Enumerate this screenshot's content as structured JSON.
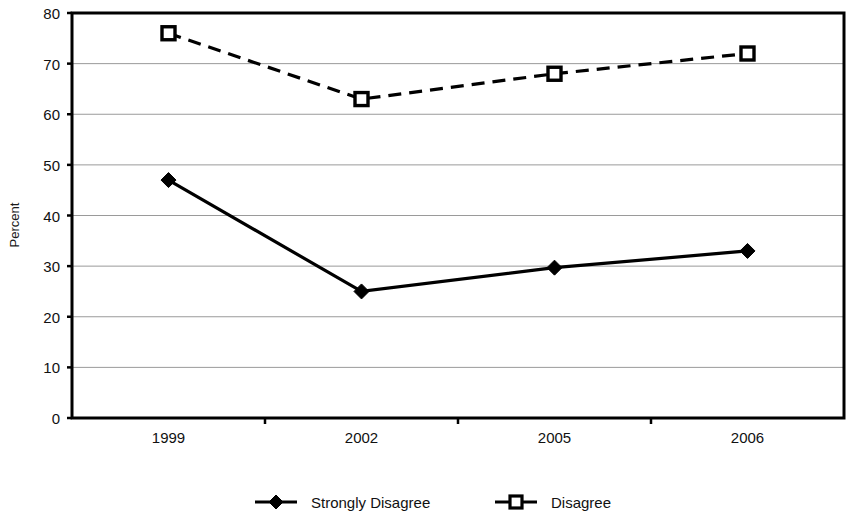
{
  "chart_data": {
    "type": "line",
    "title": "",
    "xlabel": "",
    "ylabel": "Percent",
    "categories": [
      "1999",
      "2002",
      "2005",
      "2006"
    ],
    "ylim": [
      0,
      80
    ],
    "ytick_step": 10,
    "yticks": [
      "0",
      "10",
      "20",
      "30",
      "40",
      "50",
      "60",
      "70",
      "80"
    ],
    "grid": "horizontal",
    "legend_position": "bottom",
    "series": [
      {
        "name": "Strongly Disagree",
        "values": [
          47,
          25,
          29.7,
          33
        ],
        "line_style": "solid",
        "marker": "filled-diamond",
        "color": "#000000"
      },
      {
        "name": "Disagree",
        "values": [
          76,
          63,
          68,
          72
        ],
        "line_style": "dashed",
        "marker": "open-square",
        "color": "#000000"
      }
    ]
  },
  "axis": {
    "y_label": "Percent"
  },
  "legend": {
    "items": [
      {
        "label": "Strongly Disagree"
      },
      {
        "label": "Disagree"
      }
    ]
  },
  "colors": {
    "series": "#000000",
    "grid": "#9a9a9a",
    "axis": "#000000",
    "background": "#ffffff"
  }
}
